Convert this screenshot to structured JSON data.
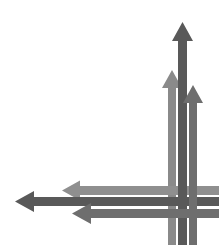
{
  "canvas": {
    "width": 219,
    "height": 245,
    "background": "#ffffff",
    "title": "Crossing arrows diagram"
  },
  "palette": {
    "dark_gray": "#595959",
    "medium_dark_gray": "#6e6e6e",
    "medium_gray": "#8a8a8a",
    "light_medium_gray": "#8f8f8f",
    "background": "#ffffff"
  },
  "diagram": {
    "kind": "arrow-weave",
    "arrow_count": 6,
    "up_arrow_count": 3,
    "left_arrow_count": 3
  },
  "arrows": [
    {
      "id": "up-arrow-1",
      "direction": "up",
      "color": "#8a8a8a",
      "shaft_x": 168,
      "shaft_width": 8,
      "tip_y": 70,
      "tail_y": 245,
      "head_width": 20,
      "head_height": 18,
      "z": 1
    },
    {
      "id": "up-arrow-2",
      "direction": "up",
      "color": "#595959",
      "shaft_x": 178,
      "shaft_width": 9,
      "tip_y": 22,
      "tail_y": 245,
      "head_width": 21,
      "head_height": 19,
      "z": 3
    },
    {
      "id": "up-arrow-3",
      "direction": "up",
      "color": "#6e6e6e",
      "shaft_x": 189,
      "shaft_width": 8,
      "tip_y": 85,
      "tail_y": 245,
      "head_width": 20,
      "head_height": 18,
      "z": 5
    },
    {
      "id": "left-arrow-1",
      "direction": "left",
      "color": "#8f8f8f",
      "shaft_y": 186,
      "shaft_height": 9,
      "tip_x": 62,
      "tail_x": 219,
      "head_width": 18,
      "head_height": 20,
      "z": 2
    },
    {
      "id": "left-arrow-2",
      "direction": "left",
      "color": "#595959",
      "shaft_y": 197,
      "shaft_height": 9,
      "tip_x": 15,
      "tail_x": 219,
      "head_width": 19,
      "head_height": 21,
      "z": 4
    },
    {
      "id": "left-arrow-3",
      "direction": "left",
      "color": "#6e6e6e",
      "shaft_y": 209,
      "shaft_height": 9,
      "tip_x": 72,
      "tail_x": 219,
      "head_width": 19,
      "head_height": 21,
      "z": 6
    }
  ]
}
